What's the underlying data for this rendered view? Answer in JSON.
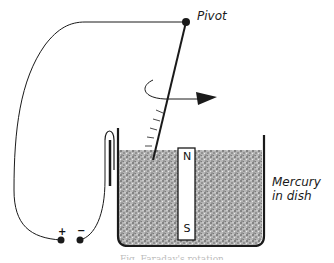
{
  "diagram": {
    "type": "physics-apparatus",
    "labels": {
      "pivot": "Pivot",
      "mercury_line1": "Mercury",
      "mercury_line2": "in dish",
      "magnet_north": "N",
      "magnet_south": "S",
      "terminal_positive": "+",
      "terminal_negative": "−"
    },
    "caption": "Fig. Faraday's rotation",
    "components": [
      {
        "name": "pivot",
        "description": "fixed pivot point from which the wire hangs"
      },
      {
        "name": "hanging-wire",
        "description": "rod hanging from pivot, dipping into mercury"
      },
      {
        "name": "rotation-arrow",
        "description": "curved arrow showing rotation of wire around the magnet"
      },
      {
        "name": "mercury-dish",
        "description": "dish filled with mercury"
      },
      {
        "name": "bar-magnet",
        "description": "vertical bar magnet, N up, S down"
      },
      {
        "name": "battery-terminals",
        "description": "positive and negative terminals"
      },
      {
        "name": "connecting-wires",
        "description": "circuit wires from terminals to pivot and to mercury"
      }
    ],
    "colors": {
      "ink": "#1a1a1a",
      "mercury_fill": "#9a9a9a",
      "background": "#ffffff"
    }
  }
}
